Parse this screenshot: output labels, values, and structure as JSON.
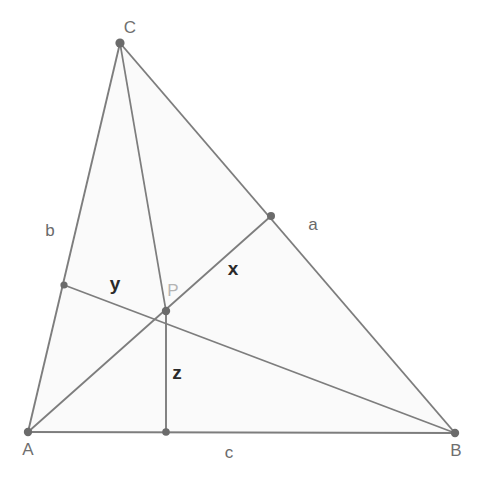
{
  "figure": {
    "kind": "geometry-diagram",
    "width": 484,
    "height": 488,
    "background_color": "#ffffff",
    "interior_fill_color": "#fafafa",
    "line_color": "#7d7d7d",
    "dot_color": "#6b6b6b"
  },
  "vertices": [
    {
      "id": "A",
      "label": "A",
      "x": 28,
      "y": 432,
      "label_x": 28,
      "label_y": 449
    },
    {
      "id": "B",
      "label": "B",
      "x": 455,
      "y": 433,
      "label_x": 456,
      "label_y": 450
    },
    {
      "id": "C",
      "label": "C",
      "x": 120,
      "y": 43,
      "label_x": 130,
      "label_y": 27
    }
  ],
  "interior_point": {
    "id": "P",
    "label": "P",
    "x": 166,
    "y": 311,
    "label_x": 173,
    "label_y": 290,
    "label_color": "#b4b4b4"
  },
  "feet": [
    {
      "id": "foot-a",
      "on_side": "a",
      "x": 271,
      "y": 216
    },
    {
      "id": "foot-b",
      "on_side": "b",
      "x": 64,
      "y": 285
    },
    {
      "id": "foot-c",
      "on_side": "c",
      "x": 166,
      "y": 432
    }
  ],
  "side_labels": [
    {
      "id": "a",
      "label": "a",
      "x": 313,
      "y": 224
    },
    {
      "id": "b",
      "label": "b",
      "x": 50,
      "y": 230
    },
    {
      "id": "c",
      "label": "c",
      "x": 229,
      "y": 452
    }
  ],
  "segment_labels": [
    {
      "id": "x",
      "label": "x",
      "x": 233,
      "y": 268
    },
    {
      "id": "y",
      "label": "y",
      "x": 115,
      "y": 283
    },
    {
      "id": "z",
      "label": "z",
      "x": 177,
      "y": 372
    }
  ],
  "edges": [
    {
      "id": "side-b-AC",
      "from": "A",
      "to": "C",
      "role": "triangle-side"
    },
    {
      "id": "side-a-CB",
      "from": "C",
      "to": "B",
      "role": "triangle-side"
    },
    {
      "id": "side-c-AB",
      "from": "A",
      "to": "B",
      "role": "triangle-side"
    },
    {
      "id": "cevian-C-P",
      "from": "C",
      "to": "P",
      "role": "cevian"
    },
    {
      "id": "cevian-A-P",
      "from": "A",
      "to": "P",
      "role": "cevian"
    },
    {
      "id": "cevian-B-P",
      "from": "B",
      "to": "P",
      "role": "cevian"
    },
    {
      "id": "perp-x-P-to-a",
      "from": "P",
      "to": "foot-a",
      "role": "perpendicular"
    },
    {
      "id": "perp-y-P-to-b",
      "from": "P",
      "to": "foot-b",
      "role": "perpendicular"
    },
    {
      "id": "perp-z-P-to-c",
      "from": "P",
      "to": "foot-c",
      "role": "perpendicular"
    }
  ]
}
